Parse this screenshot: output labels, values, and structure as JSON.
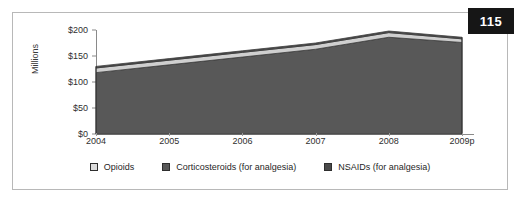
{
  "page": {
    "number": "115"
  },
  "chart_data": {
    "type": "area",
    "title": "",
    "subtitle": "",
    "xlabel": "",
    "ylabel": "Millions",
    "categories": [
      "2004",
      "2005",
      "2006",
      "2007",
      "2008",
      "2009p"
    ],
    "x_tick_labels": [
      "2004",
      "2005",
      "2006",
      "2007",
      "2008",
      "2009p"
    ],
    "y_tick_labels": [
      "$0",
      "$50",
      "$100",
      "$150",
      "$200"
    ],
    "y_tick_values": [
      0,
      50,
      100,
      150,
      200
    ],
    "ylim": [
      0,
      200
    ],
    "grid": false,
    "stacked": true,
    "legend_position": "bottom",
    "series": [
      {
        "name": "Corticosteroids (for analgesia)",
        "color": "#585858",
        "values": [
          118,
          133,
          148,
          163,
          186,
          176
        ]
      },
      {
        "name": "Opioids",
        "color": "#cfcfcf",
        "values": [
          9,
          9,
          9,
          9,
          9,
          7
        ]
      },
      {
        "name": "NSAIDs (for analgesia)",
        "color": "#4a4a4a",
        "values": [
          3,
          3,
          3,
          3,
          3,
          3
        ]
      }
    ],
    "stack_totals": [
      130,
      145,
      160,
      175,
      198,
      186
    ],
    "annotations": []
  },
  "legend": {
    "items": [
      {
        "label": "Opioids",
        "swatch_color": "#dcdcdc"
      },
      {
        "label": "Corticosteroids (for analgesia)",
        "swatch_color": "#585858"
      },
      {
        "label": "NSAIDs (for analgesia)",
        "swatch_color": "#4a4a4a"
      }
    ]
  },
  "colors": {
    "frame": "#b8b8b8",
    "axis": "#8a8a8a",
    "badge_bg": "#161616",
    "badge_text": "#ffffff",
    "text": "#2f2f2f"
  }
}
